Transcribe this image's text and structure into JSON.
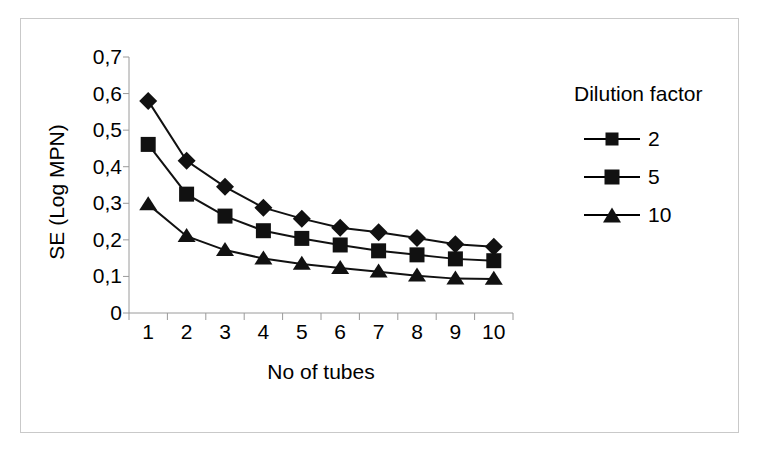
{
  "figure": {
    "background_color": "#ffffff",
    "border_color": "#c9c9c9",
    "line_color": "#111111"
  },
  "legend": {
    "title": "Dilution factor",
    "entries": [
      {
        "label": "2",
        "marker": "diamond-marker"
      },
      {
        "label": "5",
        "marker": "square-marker"
      },
      {
        "label": "10",
        "marker": "triangle-marker"
      }
    ]
  },
  "axes": {
    "x_title": "No of tubes",
    "y_title": "SE (Log MPN)",
    "x_tick_labels": [
      "1",
      "2",
      "3",
      "4",
      "5",
      "6",
      "7",
      "8",
      "9",
      "10"
    ],
    "y_tick_labels": [
      "0,7",
      "0,6",
      "0,5",
      "0,4",
      "0,3",
      "0,2",
      "0,1",
      "0"
    ]
  },
  "chart_data": {
    "type": "line",
    "title": "",
    "xlabel": "No of tubes",
    "ylabel": "SE (Log MPN)",
    "x": [
      1,
      2,
      3,
      4,
      5,
      6,
      7,
      8,
      9,
      10
    ],
    "categories": [
      "1",
      "2",
      "3",
      "4",
      "5",
      "6",
      "7",
      "8",
      "9",
      "10"
    ],
    "xlim": [
      0.5,
      10.5
    ],
    "ylim": [
      0,
      0.7
    ],
    "ytick_values": [
      0.7,
      0.6,
      0.5,
      0.4,
      0.3,
      0.2,
      0.1,
      0
    ],
    "decimal_separator": ",",
    "grid": false,
    "legend_position": "right",
    "legend_title": "Dilution factor",
    "series": [
      {
        "name": "2",
        "marker": "diamond",
        "color": "#111111",
        "values": [
          0.58,
          0.416,
          0.345,
          0.288,
          0.258,
          0.233,
          0.221,
          0.205,
          0.188,
          0.181
        ]
      },
      {
        "name": "5",
        "marker": "square",
        "color": "#111111",
        "values": [
          0.461,
          0.325,
          0.265,
          0.225,
          0.204,
          0.186,
          0.17,
          0.159,
          0.148,
          0.143
        ]
      },
      {
        "name": "10",
        "marker": "triangle",
        "color": "#111111",
        "values": [
          0.297,
          0.21,
          0.172,
          0.149,
          0.134,
          0.123,
          0.113,
          0.102,
          0.094,
          0.093
        ]
      }
    ]
  }
}
